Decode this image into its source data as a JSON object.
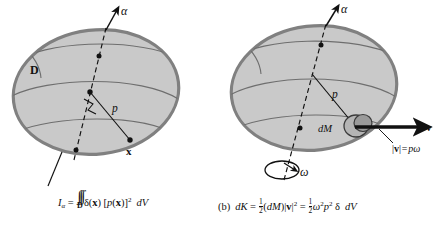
{
  "figure": {
    "kind": "physics-diagram",
    "background_color": "#ffffff",
    "solid_fill_color": "#c9c9c9",
    "solid_outline_color": "#808080",
    "line_color": "#111111"
  },
  "panel_a": {
    "label": "",
    "axis_label": "α",
    "region_label": "D",
    "distance_label": "p",
    "point_label": "x",
    "caption": {
      "lhs_symbol": "I",
      "lhs_subscript": "α",
      "equals": "=",
      "integral_signs": "∫∫∫",
      "integral_domain": "D",
      "density_symbol": "δ",
      "density_arg_open": "(",
      "density_arg": "x",
      "density_arg_close": ")",
      "bracket_open": "[",
      "p_symbol": "p",
      "p_arg_open": "(",
      "p_arg": "x",
      "p_arg_close": ")",
      "bracket_close": "]",
      "exponent": "2",
      "volume_element_d": "d",
      "volume_element_v": "V"
    }
  },
  "panel_b": {
    "label": "(b)",
    "axis_label": "α",
    "angular_velocity_label": "ω",
    "mass_element_label": "dM",
    "distance_label": "p",
    "velocity_label": "v",
    "speed_relation": {
      "bar_open": "|",
      "vector": "v",
      "bar_close": "|",
      "equals": "=",
      "p": "p",
      "omega": "ω"
    },
    "caption": {
      "lhs_d": "d",
      "lhs_k": "K",
      "equals_1": "=",
      "half_num": "1",
      "half_den": "2",
      "paren_open": "(",
      "dm_d": "d",
      "dm_m": "M",
      "paren_close": ")",
      "bar_open": "|",
      "vector": "v",
      "bar_close": "|",
      "exponent_2": "2",
      "equals_2": "=",
      "half2_num": "1",
      "half2_den": "2",
      "omega": "ω",
      "omega_exp": "2",
      "p": "p",
      "p_exp": "2",
      "delta": "δ",
      "volume_element_d": "d",
      "volume_element_v": "V"
    }
  }
}
